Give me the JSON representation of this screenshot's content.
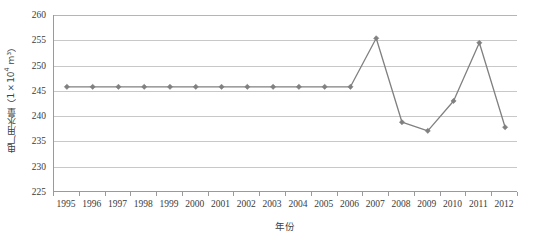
{
  "chart_data": {
    "type": "line",
    "title": "",
    "xlabel": "年份",
    "ylabel": "电厂用水量（1×10⁴ m³）",
    "ylabel_parts": {
      "prefix": "电厂用水量（1×10",
      "exponent": "4",
      "suffix": " m³）"
    },
    "categories": [
      "1995",
      "1996",
      "1997",
      "1998",
      "1999",
      "2000",
      "2001",
      "2002",
      "2003",
      "2004",
      "2005",
      "2006",
      "2007",
      "2008",
      "2009",
      "2010",
      "2011",
      "2012"
    ],
    "series": [
      {
        "name": "电厂用水量",
        "values": [
          245.8,
          245.8,
          245.8,
          245.8,
          245.8,
          245.8,
          245.8,
          245.8,
          245.8,
          245.8,
          245.8,
          245.8,
          255.4,
          238.8,
          237.1,
          243.0,
          254.5,
          237.8
        ]
      }
    ],
    "ylim": [
      225,
      260
    ],
    "yticks": [
      225,
      230,
      235,
      240,
      245,
      250,
      255,
      260
    ],
    "ytick_labels": [
      "225",
      "230",
      "235",
      "240",
      "245",
      "250",
      "255",
      "260"
    ],
    "grid": true,
    "grid_axis": "y",
    "legend": false,
    "legend_position": "none",
    "marker": "diamond",
    "line_color": "#808080",
    "marker_color": "#808080",
    "grid_color": "#c8c8c8",
    "axis_color": "#9a9a9a",
    "plot_background": "#ffffff"
  }
}
